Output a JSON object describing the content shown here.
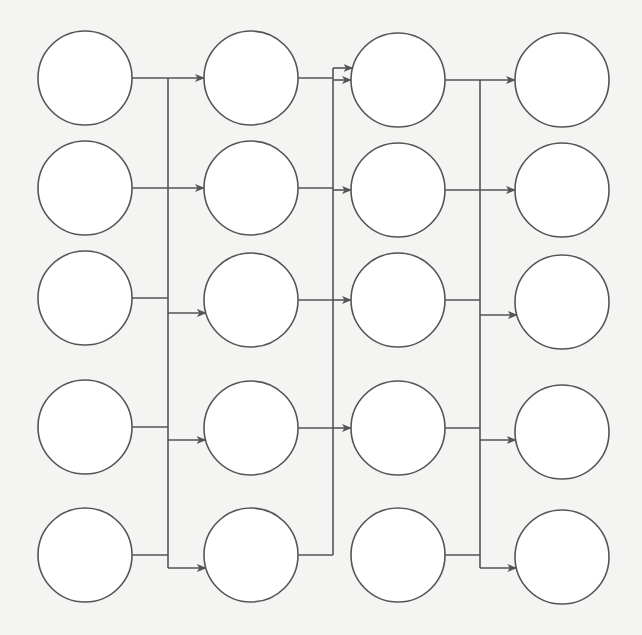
{
  "diagram": {
    "title": "",
    "type": "layered-network",
    "colors": {
      "background": "#f4f4f2",
      "stroke": "#555555",
      "node_fill": "#ffffff"
    },
    "node_radius": 47,
    "columns": [
      {
        "id": "c1",
        "x": 85,
        "rows_y": [
          78,
          188,
          298,
          427,
          555
        ]
      },
      {
        "id": "c2",
        "x": 251,
        "rows_y": [
          78,
          188,
          300,
          428,
          555
        ]
      },
      {
        "id": "c3",
        "x": 398,
        "rows_y": [
          80,
          190,
          300,
          428,
          555
        ]
      },
      {
        "id": "c4",
        "x": 562,
        "rows_y": [
          80,
          190,
          302,
          432,
          557
        ]
      }
    ],
    "buses": [
      {
        "x": 168,
        "y_top": 78,
        "y_bottom": 568,
        "inputs_from_col": 1,
        "taps_in": [
          78,
          188,
          298,
          427,
          555
        ],
        "arrows_out": [
          78,
          188,
          313,
          440,
          568
        ]
      },
      {
        "x": 333,
        "y_top": 68,
        "y_bottom": 555,
        "inputs_from_col": 2,
        "taps_in": [
          80,
          190,
          300,
          428,
          555
        ],
        "arrows_out": [
          68,
          80,
          190,
          300,
          428
        ]
      },
      {
        "x": 480,
        "y_top": 80,
        "y_bottom": 568,
        "inputs_from_col": 3,
        "taps_in": [
          80,
          190,
          300,
          428,
          555
        ],
        "arrows_out": [
          80,
          190,
          315,
          440,
          568
        ]
      }
    ],
    "node_labels": []
  }
}
